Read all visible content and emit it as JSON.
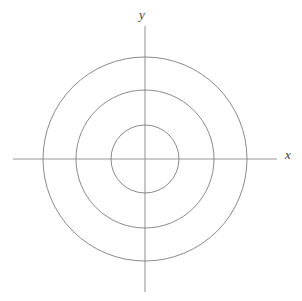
{
  "figure": {
    "background_color": "#ffffff",
    "width": 302,
    "height": 301
  },
  "axes": {
    "x_label": "x",
    "y_label": "y",
    "axis_color": "#9a9a9a",
    "axis_line_width": 1.1,
    "origin": {
      "x": 145,
      "y": 159
    },
    "x_axis_extent": {
      "start": 13,
      "end": 277
    },
    "y_axis_extent": {
      "start": 26,
      "end": 292
    }
  },
  "chart_data": {
    "type": "line",
    "title": "",
    "subtitle": "",
    "xlabel": "x",
    "ylabel": "y",
    "grid": false,
    "legend_position": "none",
    "center": {
      "x": 0,
      "y": 0
    },
    "circle_color": "#7d7d7d",
    "circle_line_width": 0.9,
    "series": [
      {
        "name": "inner circle",
        "radius_px": 34,
        "center_px": {
          "x": 145,
          "y": 159
        }
      },
      {
        "name": "middle circle",
        "radius_px": 69,
        "center_px": {
          "x": 145,
          "y": 159
        }
      },
      {
        "name": "outer circle",
        "radius_px": 102,
        "center_px": {
          "x": 145,
          "y": 159
        }
      }
    ],
    "radii_px": [
      34,
      69,
      102
    ],
    "x_intersections_px": [
      111,
      76,
      43,
      179,
      214,
      247
    ],
    "y_intersections_px": [
      125,
      90,
      57,
      193,
      228,
      261
    ],
    "xlim": [
      -120,
      120
    ],
    "ylim": [
      -120,
      120
    ]
  }
}
